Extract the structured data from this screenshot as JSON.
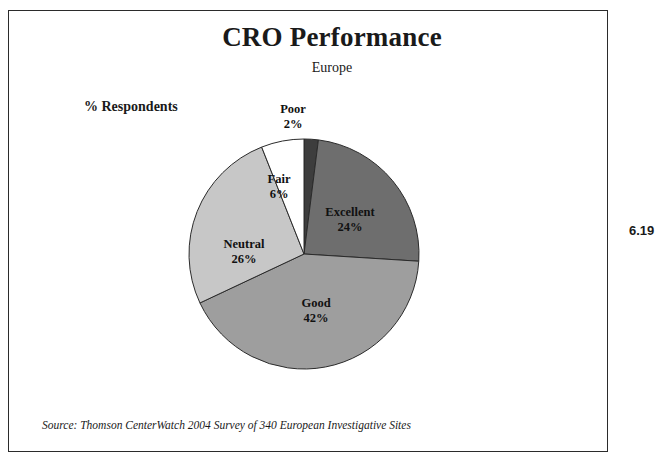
{
  "figure": {
    "number": "6.19",
    "source_note": "Source:  Thomson CenterWatch 2004 Survey of 340 European Investigative Sites"
  },
  "chart_data": {
    "type": "pie",
    "title": "CRO Performance",
    "subtitle": "Europe",
    "value_axis_label": "% Respondents",
    "unit": "%",
    "start_angle_deg": 0,
    "direction": "clockwise",
    "legend": "none-inline-labels",
    "categories": [
      "Poor",
      "Excellent",
      "Good",
      "Neutral",
      "Fair"
    ],
    "values": [
      2,
      24,
      42,
      26,
      6
    ],
    "slices": [
      {
        "label": "Poor",
        "value": 2,
        "value_text": "2%",
        "color": "#3d3d3d"
      },
      {
        "label": "Excellent",
        "value": 24,
        "value_text": "24%",
        "color": "#6e6e6e"
      },
      {
        "label": "Good",
        "value": 42,
        "value_text": "42%",
        "color": "#9e9e9e"
      },
      {
        "label": "Neutral",
        "value": 26,
        "value_text": "26%",
        "color": "#c7c7c7"
      },
      {
        "label": "Fair",
        "value": 6,
        "value_text": "6%",
        "color": "#ffffff"
      }
    ],
    "colors": {
      "poor": "#3d3d3d",
      "excellent": "#6e6e6e",
      "good": "#9e9e9e",
      "neutral": "#c7c7c7",
      "fair": "#ffffff",
      "outline": "#2b2b2b",
      "frame": "#2b2b2b",
      "background": "#ffffff"
    }
  }
}
